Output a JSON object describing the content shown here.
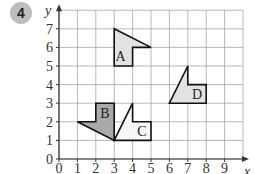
{
  "question": {
    "number": "4"
  },
  "chart_data": {
    "type": "coordinate-grid",
    "xlabel": "x",
    "ylabel": "y",
    "x_ticks": [
      "0",
      "1",
      "2",
      "3",
      "4",
      "5",
      "6",
      "7",
      "8",
      "9"
    ],
    "y_ticks": [
      "0",
      "1",
      "2",
      "3",
      "4",
      "5",
      "6",
      "7"
    ],
    "xlim": [
      0,
      10
    ],
    "ylim": [
      0,
      8
    ],
    "grid": true,
    "shapes": [
      {
        "label": "A",
        "fill": "#e2e2e2",
        "points": [
          [
            3,
            7
          ],
          [
            5,
            6
          ],
          [
            4,
            6
          ],
          [
            4,
            5
          ],
          [
            3,
            5
          ]
        ],
        "label_pos": [
          3.35,
          5.55
        ]
      },
      {
        "label": "B",
        "fill": "#a9a9a9",
        "points": [
          [
            1,
            2
          ],
          [
            2,
            2
          ],
          [
            2,
            3
          ],
          [
            3,
            3
          ],
          [
            3,
            1
          ]
        ],
        "label_pos": [
          2.5,
          2.5
        ]
      },
      {
        "label": "C",
        "fill": "#f7f7f7",
        "points": [
          [
            3,
            1
          ],
          [
            4,
            3
          ],
          [
            4,
            2
          ],
          [
            5,
            2
          ],
          [
            5,
            1
          ]
        ],
        "label_pos": [
          4.5,
          1.5
        ]
      },
      {
        "label": "D",
        "fill": "#e2e2e2",
        "points": [
          [
            6,
            3
          ],
          [
            7,
            5
          ],
          [
            7,
            4
          ],
          [
            8,
            4
          ],
          [
            8,
            3
          ]
        ],
        "label_pos": [
          7.5,
          3.5
        ]
      }
    ]
  }
}
